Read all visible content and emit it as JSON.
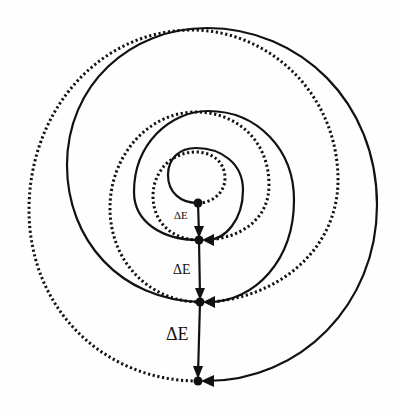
{
  "diagram": {
    "type": "energy-spiral",
    "colors": {
      "line": "#111111",
      "background": "#fefefe"
    },
    "nodes": [
      {
        "id": "p0",
        "x": 198,
        "y": 203
      },
      {
        "id": "p1",
        "x": 199,
        "y": 240
      },
      {
        "id": "p2",
        "x": 200,
        "y": 302
      },
      {
        "id": "p3",
        "x": 198,
        "y": 381
      }
    ],
    "steps": [
      {
        "from": "p0",
        "to": "p1",
        "label": "ΔE",
        "font_size": 11
      },
      {
        "from": "p1",
        "to": "p2",
        "label": "ΔE",
        "font_size": 14
      },
      {
        "from": "p2",
        "to": "p3",
        "label": "ΔE",
        "font_size": 18
      }
    ],
    "loops": [
      {
        "from": "p0",
        "to": "p1",
        "solid": "counterclockwise",
        "dotted": "clockwise"
      },
      {
        "from": "p1",
        "to": "p2",
        "solid": "counterclockwise",
        "dotted": "clockwise"
      },
      {
        "from": "p2",
        "to": "p3",
        "solid": "counterclockwise",
        "dotted": "clockwise"
      }
    ]
  }
}
